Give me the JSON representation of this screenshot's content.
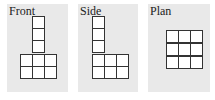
{
  "views": [
    {
      "id": "front",
      "label": "Front",
      "description": "3 cubes wide base row x2, with a 3-cube column rising from the middle"
    },
    {
      "id": "side",
      "label": "Side",
      "description": "L-shape: 5-tall column on left, 2x2 extension to right at bottom"
    },
    {
      "id": "plan",
      "label": "Plan",
      "description": "3x3 square grid"
    }
  ],
  "colors": {
    "panel_bg": "#e9e9e9",
    "grid_line": "#333333",
    "cell_fill": "#ffffff"
  }
}
